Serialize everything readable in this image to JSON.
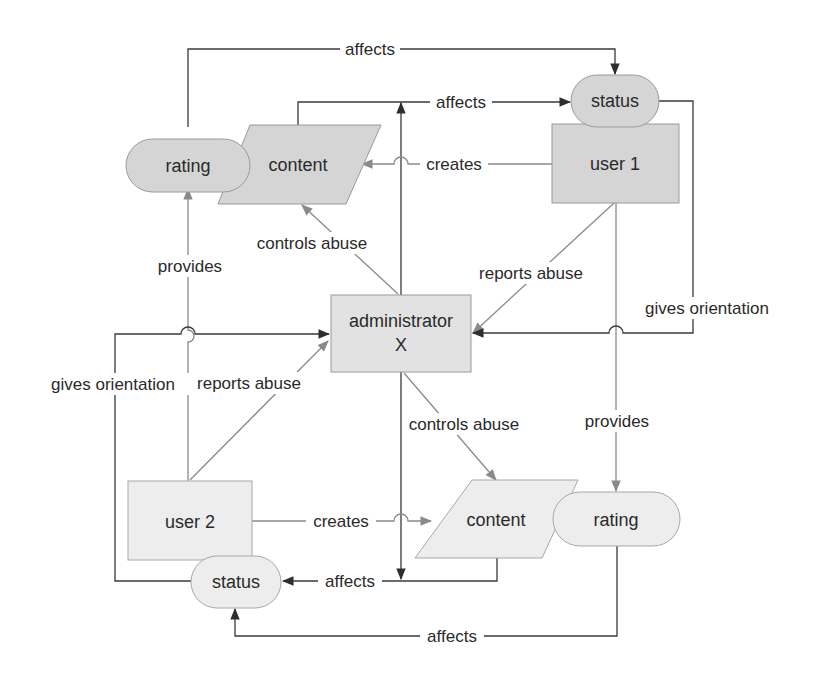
{
  "colors": {
    "top_fill": "#d5d5d5",
    "admin_fill": "#e2e2e2",
    "bottom_fill": "#ededed",
    "stroke_dark": "#3a3a3a",
    "stroke_grey": "#8a8a8a",
    "text": "#2a2a2a"
  },
  "nodes": {
    "status_top": {
      "label": "status",
      "shape": "rounded"
    },
    "user1": {
      "label": "user 1",
      "shape": "rectangle"
    },
    "rating_top": {
      "label": "rating",
      "shape": "rounded"
    },
    "content_top": {
      "label": "content",
      "shape": "parallelogram"
    },
    "admin": {
      "label": "administrator",
      "sublabel": "X",
      "shape": "rectangle"
    },
    "user2": {
      "label": "user 2",
      "shape": "rectangle"
    },
    "status_bottom": {
      "label": "status",
      "shape": "rounded"
    },
    "content_bottom": {
      "label": "content",
      "shape": "parallelogram"
    },
    "rating_bottom": {
      "label": "rating",
      "shape": "rounded"
    }
  },
  "edges": [
    {
      "id": "rating_top-affects-status_top",
      "label": "affects"
    },
    {
      "id": "content_top-affects-status_top",
      "label": "affects"
    },
    {
      "id": "user1-creates-content_top",
      "label": "creates"
    },
    {
      "id": "admin-controls-content_top",
      "label": "controls abuse"
    },
    {
      "id": "user2-provides-rating_top",
      "label": "provides"
    },
    {
      "id": "user1-reports-admin",
      "label": "reports abuse"
    },
    {
      "id": "status_top-gives-admin",
      "label": "gives orientation"
    },
    {
      "id": "status_bottom-gives-admin",
      "label": "gives orientation"
    },
    {
      "id": "user2-reports-admin",
      "label": "reports abuse"
    },
    {
      "id": "admin-controls-content_bottom",
      "label": "controls abuse"
    },
    {
      "id": "user1-provides-rating_bottom",
      "label": "provides"
    },
    {
      "id": "user2-creates-content_bottom",
      "label": "creates"
    },
    {
      "id": "content_bottom-affects-status_bottom",
      "label": "affects"
    },
    {
      "id": "rating_bottom-affects-status_bottom",
      "label": "affects"
    }
  ]
}
